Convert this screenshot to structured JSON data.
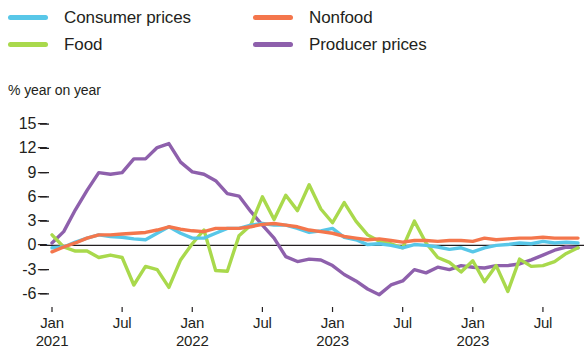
{
  "axis_title": "% year on year",
  "legend": [
    {
      "label": "Consumer prices",
      "color": "#58C7E8",
      "key": "consumer_prices"
    },
    {
      "label": "Nonfood",
      "color": "#F4764C",
      "key": "nonfood"
    },
    {
      "label": "Food",
      "color": "#A9D94C",
      "key": "food"
    },
    {
      "label": "Producer prices",
      "color": "#8E60AC",
      "key": "producer_prices"
    }
  ],
  "chart_data": {
    "type": "line",
    "title": "",
    "subtitle": "",
    "xlabel": "",
    "ylabel": "% year on year",
    "ylim": [
      -7.5,
      16.5
    ],
    "yticks": [
      15,
      12,
      9,
      6,
      3,
      0,
      -3,
      -6
    ],
    "ytick_labels": [
      "15",
      "12",
      "9",
      "6",
      "3",
      "0",
      "-3",
      "-6"
    ],
    "grid": false,
    "zero_line": true,
    "legend_position": "top",
    "x_major_labels": [
      {
        "month": "Jan",
        "year": "2021",
        "index": 0
      },
      {
        "month": "Jul",
        "year": "",
        "index": 6
      },
      {
        "month": "Jan",
        "year": "2022",
        "index": 12
      },
      {
        "month": "Jul",
        "year": "",
        "index": 18
      },
      {
        "month": "Jan",
        "year": "2023",
        "index": 24
      },
      {
        "month": "Jul",
        "year": "",
        "index": 30
      },
      {
        "month": "Jan",
        "year": "2023",
        "index": 36
      },
      {
        "month": "Jul",
        "year": "",
        "index": 42
      }
    ],
    "x": [
      0,
      1,
      2,
      3,
      4,
      5,
      6,
      7,
      8,
      9,
      10,
      11,
      12,
      13,
      14,
      15,
      16,
      17,
      18,
      19,
      20,
      21,
      22,
      23,
      24,
      25,
      26,
      27,
      28,
      29,
      30,
      31,
      32,
      33,
      34,
      35,
      36,
      37,
      38,
      39,
      40,
      41,
      42,
      43,
      44,
      45
    ],
    "series": [
      {
        "name": "Consumer prices",
        "color": "#58C7E8",
        "values": [
          -0.3,
          -0.2,
          0.4,
          0.9,
          1.3,
          1.1,
          1.0,
          0.8,
          0.7,
          1.5,
          2.3,
          1.5,
          0.9,
          0.9,
          1.5,
          2.1,
          2.1,
          2.5,
          2.7,
          2.5,
          2.5,
          2.1,
          1.6,
          1.8,
          2.1,
          1.0,
          0.7,
          0.1,
          0.2,
          0.0,
          -0.3,
          0.1,
          0.0,
          -0.2,
          -0.5,
          -0.3,
          -0.8,
          -0.3,
          0.0,
          0.1,
          0.3,
          0.2,
          0.5,
          0.3,
          0.4,
          0.3
        ]
      },
      {
        "name": "Food",
        "color": "#A9D94C",
        "values": [
          1.3,
          -0.2,
          -0.7,
          -0.7,
          -1.5,
          -1.2,
          -1.5,
          -4.9,
          -2.6,
          -3.0,
          -5.2,
          -1.8,
          0.2,
          1.9,
          -3.1,
          -3.2,
          1.2,
          2.5,
          6.0,
          3.2,
          6.2,
          4.3,
          7.5,
          4.5,
          2.8,
          5.3,
          3.0,
          1.3,
          0.5,
          0.2,
          -0.3,
          3.0,
          0.3,
          -1.5,
          -2.1,
          -3.3,
          -1.9,
          -4.5,
          -2.5,
          -5.7,
          -1.7,
          -2.6,
          -2.5,
          -2.0,
          -1.0,
          -0.3
        ]
      },
      {
        "name": "Nonfood",
        "color": "#F4764C",
        "values": [
          -0.8,
          -0.2,
          0.3,
          0.9,
          1.3,
          1.3,
          1.4,
          1.5,
          1.6,
          1.9,
          2.3,
          2.0,
          1.8,
          1.7,
          2.1,
          2.1,
          2.1,
          2.3,
          2.6,
          2.7,
          2.5,
          2.3,
          1.9,
          1.7,
          1.5,
          1.1,
          0.9,
          0.7,
          0.8,
          0.6,
          0.4,
          0.6,
          0.6,
          0.5,
          0.6,
          0.6,
          0.5,
          0.9,
          0.7,
          0.8,
          0.9,
          0.9,
          1.0,
          0.9,
          0.9,
          0.9
        ]
      },
      {
        "name": "Producer prices",
        "color": "#8E60AC",
        "values": [
          0.3,
          1.7,
          4.4,
          6.8,
          9.0,
          8.8,
          9.0,
          10.7,
          10.7,
          12.1,
          12.6,
          10.3,
          9.1,
          8.8,
          8.0,
          6.4,
          6.1,
          4.2,
          2.5,
          0.9,
          -1.4,
          -2.0,
          -1.7,
          -1.8,
          -2.5,
          -3.6,
          -4.4,
          -5.4,
          -6.1,
          -4.9,
          -4.4,
          -3.0,
          -3.4,
          -2.7,
          -3.0,
          -2.5,
          -2.7,
          -2.8,
          -2.5,
          -2.5,
          -2.3,
          -1.8,
          -1.2,
          -0.6,
          -0.2,
          -0.3
        ]
      }
    ]
  }
}
